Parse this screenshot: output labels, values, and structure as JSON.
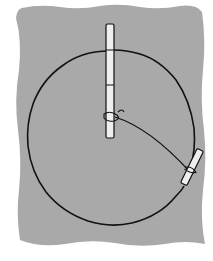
{
  "diagram": {
    "colors": {
      "paper": "#ffffff",
      "ground": "#a9a9a9",
      "ink": "#111111",
      "stake_fill": "#eeeeee"
    },
    "ground": {
      "x": 15,
      "y": 6,
      "width": 190,
      "height": 238
    },
    "circle": {
      "cx": 112,
      "cy": 138,
      "rx": 84,
      "ry": 87
    },
    "center_stake": {
      "x": 106,
      "top": 24,
      "bottom": 138,
      "width": 8,
      "bands": [
        50,
        85
      ],
      "knot_y": 116
    },
    "string": {
      "from": [
        117,
        117
      ],
      "control": [
        155,
        130
      ],
      "to": [
        190,
        172
      ]
    },
    "edge_stake": {
      "x1": 201,
      "y1": 149,
      "x2": 183,
      "y2": 186,
      "width": 7
    },
    "labels": []
  }
}
